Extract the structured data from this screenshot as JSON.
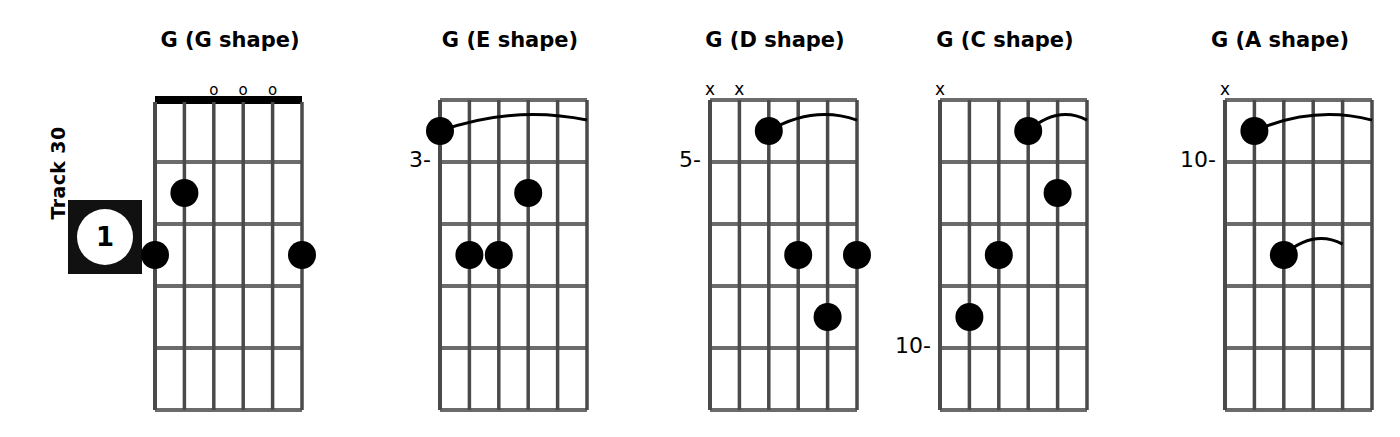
{
  "track": {
    "label": "Track 30",
    "badge_number": "1"
  },
  "colors": {
    "ink": "#000000",
    "string": "#4a4a4a",
    "fret": "#6b6b6b",
    "background": "#ffffff",
    "badge_bg": "#111111"
  },
  "layout": {
    "strings": 6,
    "frets": 5,
    "grid_width": 147,
    "grid_height": 310,
    "grid_top": 100,
    "dot_radius": 14
  },
  "diagrams": [
    {
      "id": "g-g-shape",
      "title": "G (G shape)",
      "left": 140,
      "grid_left": 15,
      "width": 180,
      "nut": true,
      "fret_label": "",
      "fret_label_fret": 0,
      "top_markers": [
        {
          "symbol": "o",
          "string": 3
        },
        {
          "symbol": "o",
          "string": 4
        },
        {
          "symbol": "o",
          "string": 5
        }
      ],
      "dots": [
        {
          "string": 2,
          "fret": 2
        },
        {
          "string": 1,
          "fret": 3
        },
        {
          "string": 6,
          "fret": 3
        }
      ],
      "barres": []
    },
    {
      "id": "g-e-shape",
      "title": "G (E shape)",
      "left": 400,
      "grid_left": 40,
      "width": 220,
      "nut": false,
      "fret_label": "3-",
      "fret_label_fret": 1,
      "top_markers": [],
      "dots": [
        {
          "string": 1,
          "fret": 1
        },
        {
          "string": 4,
          "fret": 2
        },
        {
          "string": 3,
          "fret": 3
        },
        {
          "string": 2,
          "fret": 3
        }
      ],
      "barres": [
        {
          "fret": 1,
          "from_string": 1,
          "to_string": 6
        }
      ]
    },
    {
      "id": "g-d-shape",
      "title": "G (D shape)",
      "left": 665,
      "grid_left": 45,
      "width": 220,
      "nut": false,
      "fret_label": "5-",
      "fret_label_fret": 1,
      "top_markers": [
        {
          "symbol": "x",
          "string": 1
        },
        {
          "symbol": "x",
          "string": 2
        }
      ],
      "dots": [
        {
          "string": 3,
          "fret": 1
        },
        {
          "string": 4,
          "fret": 3
        },
        {
          "string": 6,
          "fret": 3
        },
        {
          "string": 5,
          "fret": 4
        }
      ],
      "barres": [
        {
          "fret": 1,
          "from_string": 3,
          "to_string": 6
        }
      ]
    },
    {
      "id": "g-c-shape",
      "title": "G (C shape)",
      "left": 895,
      "grid_left": 45,
      "width": 220,
      "nut": false,
      "fret_label": "10-",
      "fret_label_fret": 4,
      "top_markers": [
        {
          "symbol": "x",
          "string": 1
        }
      ],
      "dots": [
        {
          "string": 4,
          "fret": 1
        },
        {
          "string": 5,
          "fret": 2
        },
        {
          "string": 3,
          "fret": 3
        },
        {
          "string": 2,
          "fret": 4
        }
      ],
      "barres": [
        {
          "fret": 1,
          "from_string": 4,
          "to_string": 6
        }
      ]
    },
    {
      "id": "g-a-shape",
      "title": "G (A shape)",
      "left": 1165,
      "grid_left": 60,
      "width": 230,
      "nut": false,
      "fret_label": "10-",
      "fret_label_fret": 1,
      "top_markers": [
        {
          "symbol": "x",
          "string": 1
        }
      ],
      "dots": [
        {
          "string": 2,
          "fret": 1
        },
        {
          "string": 3,
          "fret": 3
        }
      ],
      "barres": [
        {
          "fret": 1,
          "from_string": 2,
          "to_string": 6
        },
        {
          "fret": 3,
          "from_string": 3,
          "to_string": 5
        }
      ]
    }
  ]
}
